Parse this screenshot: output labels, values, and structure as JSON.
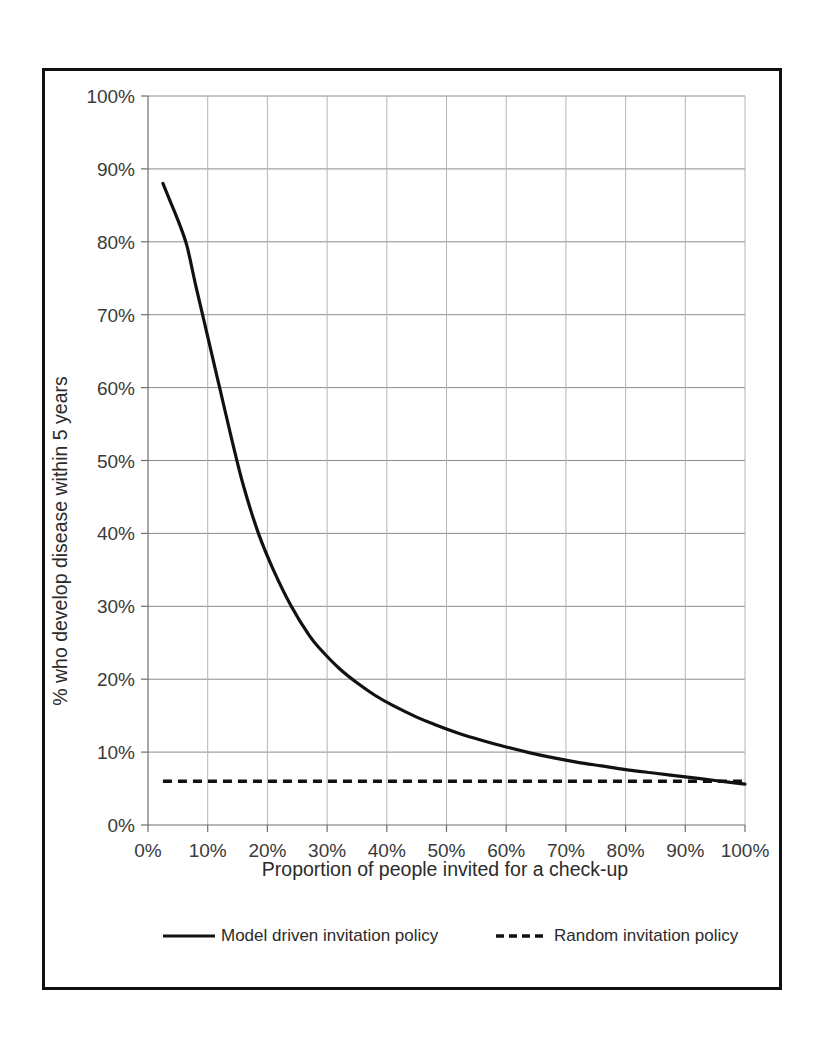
{
  "chart_data": {
    "type": "line",
    "title": "",
    "xlabel": "Proportion of people invited for a check-up",
    "ylabel": "% who develop disease within 5 years",
    "xlim": [
      0,
      100
    ],
    "ylim": [
      0,
      100
    ],
    "grid": true,
    "legend_position": "bottom",
    "x_tick_labels": [
      "0%",
      "10%",
      "20%",
      "30%",
      "40%",
      "50%",
      "60%",
      "70%",
      "80%",
      "90%",
      "100%"
    ],
    "x_tick_values": [
      0,
      10,
      20,
      30,
      40,
      50,
      60,
      70,
      80,
      90,
      100
    ],
    "y_tick_labels": [
      "0%",
      "10%",
      "20%",
      "30%",
      "40%",
      "50%",
      "60%",
      "70%",
      "80%",
      "90%",
      "100%"
    ],
    "y_tick_values": [
      0,
      10,
      20,
      30,
      40,
      50,
      60,
      70,
      80,
      90,
      100
    ],
    "series": [
      {
        "name": "Model driven invitation policy",
        "style": "solid",
        "color": "#111111",
        "x": [
          2.5,
          3.5,
          5,
          6.5,
          8,
          10,
          12,
          14,
          16,
          18.5,
          21,
          24,
          27,
          29,
          32,
          35,
          38,
          41,
          45,
          48,
          52,
          56,
          60,
          64,
          68,
          72,
          76,
          80,
          85,
          90,
          95,
          100
        ],
        "y": [
          88,
          86,
          83,
          79.5,
          74,
          67,
          60,
          53,
          46.5,
          40,
          35,
          30,
          26,
          24,
          21.5,
          19.5,
          17.8,
          16.4,
          14.8,
          13.8,
          12.6,
          11.6,
          10.7,
          9.9,
          9.2,
          8.6,
          8.1,
          7.6,
          7.1,
          6.6,
          6.1,
          5.6
        ]
      },
      {
        "name": "Random invitation policy",
        "style": "dashed",
        "color": "#111111",
        "x": [
          2.5,
          100
        ],
        "y": [
          6,
          6
        ]
      }
    ]
  },
  "legend": {
    "entries": [
      {
        "label": "Model driven invitation policy",
        "style": "solid"
      },
      {
        "label": "Random invitation policy",
        "style": "dashed"
      }
    ]
  },
  "colors": {
    "frame": "#111111",
    "grid": "#8a8a8a",
    "series": "#111111",
    "background": "#ffffff"
  }
}
